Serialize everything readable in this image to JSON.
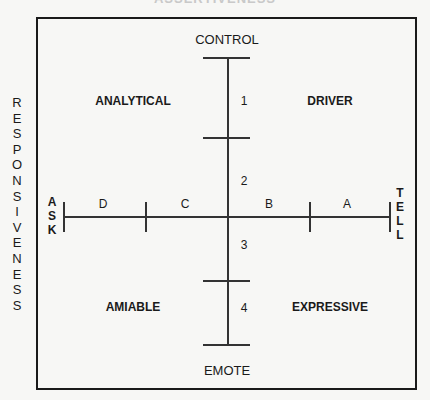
{
  "cut_title": "ASSERTIVENESS",
  "side_label": "RESPONSIVENESS",
  "axes": {
    "top": "CONTROL",
    "bottom": "EMOTE",
    "left": "ASK",
    "right": "TELL"
  },
  "quadrants": {
    "top_left": "ANALYTICAL",
    "top_right": "DRIVER",
    "bottom_left": "AMIABLE",
    "bottom_right": "EXPRESSIVE"
  },
  "vertical_segments": [
    "1",
    "2",
    "3",
    "4"
  ],
  "horizontal_segments": [
    "D",
    "C",
    "B",
    "A"
  ]
}
